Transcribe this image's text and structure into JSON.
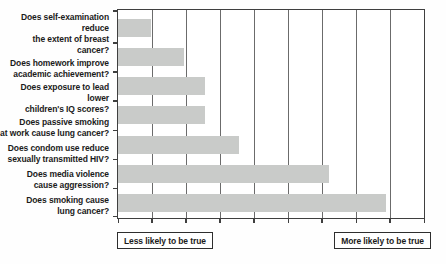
{
  "chart_data": {
    "type": "bar",
    "orientation": "horizontal",
    "title": "",
    "categories": [
      "Does self-examination reduce\nthe extent of breast cancer?",
      "Does homework improve\nacademic achievement?",
      "Does exposure to lead lower\nchildren's IQ scores?",
      "Does passive smoking\nat work cause lung cancer?",
      "Does condom use reduce\nsexually transmitted HIV?",
      "Does media violence\ncause aggression?",
      "Does smoking cause\nlung cancer?"
    ],
    "values": [
      0.97,
      1.95,
      2.55,
      2.55,
      3.55,
      6.22,
      7.89
    ],
    "xlim": [
      0,
      9
    ],
    "gridline_divisions": 9,
    "grid": "vertical-only",
    "x_tick_labels_shown": false,
    "bar_color": "#c9cbc9",
    "axis_annotations": {
      "left": "Less likely to be true",
      "right": "More likely to be true"
    }
  }
}
